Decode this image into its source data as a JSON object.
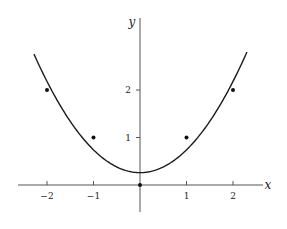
{
  "chart_data": {
    "type": "scatter",
    "title": "",
    "xlabel": "x",
    "ylabel": "y",
    "xlim": [
      -2.5,
      2.6
    ],
    "ylim": [
      -0.9,
      3.6
    ],
    "grid": false,
    "legend": null,
    "x_ticks": [
      {
        "value": -2,
        "label": "−2"
      },
      {
        "value": -1,
        "label": "−1"
      },
      {
        "value": 1,
        "label": "1"
      },
      {
        "value": 2,
        "label": "2"
      }
    ],
    "y_ticks": [
      {
        "value": 1,
        "label": "1"
      },
      {
        "value": 2,
        "label": "2"
      }
    ],
    "series": [
      {
        "name": "data points",
        "kind": "scatter",
        "x": [
          -2,
          -1,
          0,
          1,
          2
        ],
        "y": [
          2,
          1,
          0,
          1,
          2
        ]
      },
      {
        "name": "fitted curve",
        "kind": "line",
        "equation": "y = 0.26 + 0.48 x^2",
        "a": 0.26,
        "b": 0.48,
        "x_range": [
          -2.28,
          2.3
        ]
      }
    ]
  },
  "colors": {
    "axis": "#555555",
    "curve": "#1a1a1a",
    "points": "#111111",
    "background": "#ffffff"
  }
}
